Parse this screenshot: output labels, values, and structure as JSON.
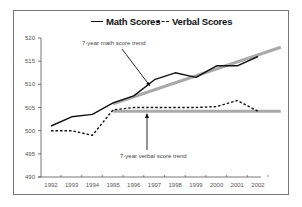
{
  "legend": {
    "math_label": "Math Scores",
    "verbal_label": "Verbal Scores"
  },
  "annotations": {
    "math_trend": "7-year math score trend",
    "verbal_trend": "7-year verbal score trend"
  },
  "colors": {
    "math_line": "#111111",
    "verbal_line": "#111111",
    "trend_line": "#aaaaaa",
    "axis": "#555555",
    "frame": "#777777"
  },
  "chart_data": {
    "type": "line",
    "title": "",
    "xlabel": "",
    "ylabel": "",
    "categories": [
      "1992",
      "1993",
      "1994",
      "1995",
      "1996",
      "1997",
      "1998",
      "1999",
      "2000",
      "2001",
      "2002"
    ],
    "series": [
      {
        "name": "Math Scores",
        "style": "solid",
        "values": [
          501,
          503,
          503.5,
          506,
          507.5,
          511,
          512.5,
          511.5,
          514,
          514,
          516
        ]
      },
      {
        "name": "Verbal Scores",
        "style": "dashed",
        "values": [
          500,
          500,
          499,
          504.5,
          505,
          505,
          505,
          505,
          505.2,
          506.5,
          504.2
        ]
      }
    ],
    "trend_lines": [
      {
        "name": "7-year math score trend",
        "from": {
          "x": 1995,
          "y": 505.8
        },
        "to": {
          "x": 2003.1,
          "y": 518
        }
      },
      {
        "name": "7-year verbal score trend",
        "from": {
          "x": 1995,
          "y": 504.2
        },
        "to": {
          "x": 2003.1,
          "y": 504.2
        }
      }
    ],
    "yticks": [
      490,
      495,
      500,
      505,
      510,
      515,
      520
    ],
    "ylim": [
      490,
      520
    ],
    "grid": false,
    "legend_position": "top"
  }
}
